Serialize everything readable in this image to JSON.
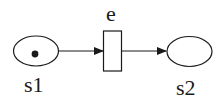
{
  "diagram": {
    "type": "petri-net",
    "places": [
      {
        "id": "s1",
        "label": "s1",
        "tokens": 1
      },
      {
        "id": "s2",
        "label": "s2",
        "tokens": 0
      }
    ],
    "transitions": [
      {
        "id": "e",
        "label": "e"
      }
    ],
    "arcs": [
      {
        "from": "s1",
        "to": "e"
      },
      {
        "from": "e",
        "to": "s2"
      }
    ],
    "colors": {
      "stroke": "#1a1a1a",
      "background": "#ffffff"
    }
  }
}
